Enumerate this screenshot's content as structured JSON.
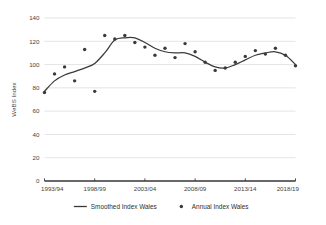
{
  "chart_data": {
    "type": "scatter",
    "title": "",
    "xlabel": "",
    "ylabel": "WeBS Index",
    "ylim": [
      0,
      140
    ],
    "yticks": [
      0,
      20,
      40,
      60,
      80,
      100,
      120,
      140
    ],
    "xticklabels": [
      "1993/94",
      "1998/99",
      "2003/04",
      "2008/09",
      "2013/14",
      "2018/19"
    ],
    "xtickyears": [
      1993,
      1998,
      2003,
      2008,
      2013,
      2018
    ],
    "xlim": [
      1993,
      2018
    ],
    "grid": "horizontal",
    "legend_position": "bottom",
    "x": [
      1993,
      1994,
      1995,
      1996,
      1997,
      1998,
      1999,
      2000,
      2001,
      2002,
      2003,
      2004,
      2005,
      2006,
      2007,
      2008,
      2009,
      2010,
      2011,
      2012,
      2013,
      2014,
      2015,
      2016,
      2017,
      2018
    ],
    "series": [
      {
        "name": "Annual Index Wales",
        "type": "scatter",
        "marker": "dot",
        "color": "#3a3a3a",
        "values": [
          76,
          92,
          98,
          86,
          113,
          77,
          125,
          122,
          125,
          119,
          115,
          108,
          114,
          106,
          118,
          111,
          102,
          95,
          97,
          102,
          107,
          112,
          109,
          114,
          108,
          99
        ]
      },
      {
        "name": "Smoothed Index Wales",
        "type": "line",
        "color": "#3a3a3a",
        "values": [
          77,
          86,
          91,
          94,
          97,
          101,
          110,
          121,
          123,
          123,
          119,
          114,
          111,
          110,
          110,
          107,
          102,
          98,
          97,
          100,
          104,
          108,
          110,
          111,
          108,
          100
        ]
      }
    ],
    "legend": [
      {
        "label": "Smoothed Index Wales",
        "marker": "line",
        "color": "#3a3a3a"
      },
      {
        "label": "Annual Index Wales",
        "marker": "dot",
        "color": "#3a3a3a"
      }
    ]
  },
  "colors": {
    "ink": "#3a3a3a",
    "grid": "#d9d9d9",
    "background": "#ffffff"
  }
}
